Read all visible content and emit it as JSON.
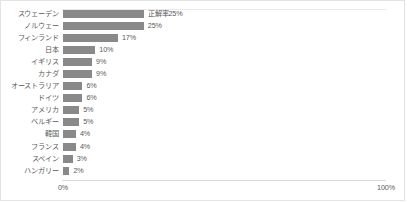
{
  "chart_data": {
    "type": "bar",
    "orientation": "horizontal",
    "title": "",
    "xlabel": "",
    "ylabel": "",
    "xlim": [
      0,
      100
    ],
    "xticks": [
      "0%",
      "100%"
    ],
    "xtick_values": [
      0,
      100
    ],
    "grid": false,
    "legend": null,
    "series_name": "正解率",
    "categories": [
      "スウェーデン",
      "ノルウェー",
      "フィンランド",
      "日本",
      "イギリス",
      "カナダ",
      "オーストラリア",
      "ドイツ",
      "アメリカ",
      "ベルギー",
      "韓国",
      "フランス",
      "スペイン",
      "ハンガリー"
    ],
    "values": [
      25,
      25,
      17,
      10,
      9,
      9,
      6,
      6,
      5,
      5,
      4,
      4,
      3,
      2
    ],
    "data_labels": [
      "正解率25%",
      "25%",
      "17%",
      "10%",
      "9%",
      "9%",
      "6%",
      "6%",
      "5%",
      "5%",
      "4%",
      "4%",
      "3%",
      "2%"
    ],
    "colors": {
      "bar": "#898989",
      "text": "#5a5a5a",
      "frame": "#e3e3e3",
      "axis_line": "#d9d9d9",
      "background": "#ffffff"
    }
  }
}
